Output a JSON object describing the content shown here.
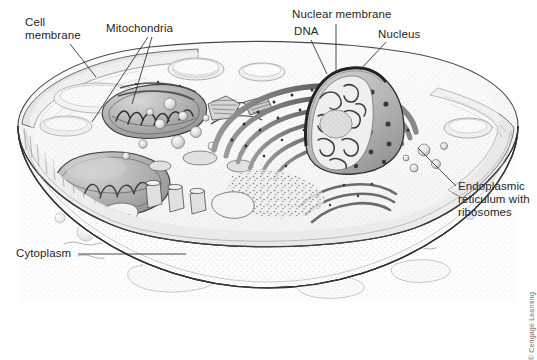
{
  "figure": {
    "type": "biological-illustration",
    "style": "grayscale pen-and-ink stipple rendering",
    "background_color": "#ffffff",
    "ink_color": "#2b2b2b"
  },
  "labels": {
    "cell_membrane": "Cell\nmembrane",
    "mitochondria": "Mitochondria",
    "nuclear_membrane": "Nuclear membrane",
    "dna": "DNA",
    "nucleus": "Nucleus",
    "endoplasmic_reticulum": "Endoplasmic\nreticulum with\nribosomes",
    "cytoplasm": "Cytoplasm"
  },
  "credit": {
    "text": "© Cengage Learning"
  },
  "structures": [
    {
      "name": "cell-membrane",
      "description": "outer boundary of the cell"
    },
    {
      "name": "mitochondria",
      "description": "bean-shaped organelles with cristae"
    },
    {
      "name": "nucleus",
      "description": "dome-shaped body with nuclear pores"
    },
    {
      "name": "nuclear-membrane",
      "description": "double membrane around nucleus"
    },
    {
      "name": "dna",
      "description": "chromatin threads inside the nucleus"
    },
    {
      "name": "nucleolus",
      "description": "dense body within the nucleus"
    },
    {
      "name": "endoplasmic-reticulum",
      "description": "concentric membrane sheets studded with ribosomes"
    },
    {
      "name": "cytoplasm",
      "description": "stippled ground substance filling the cell"
    },
    {
      "name": "vesicles",
      "description": "small round vesicles throughout cytoplasm"
    },
    {
      "name": "golgi-apparatus",
      "description": "stacked flattened sacs"
    },
    {
      "name": "centriole",
      "description": "cylindrical bundle of microtubules"
    }
  ]
}
